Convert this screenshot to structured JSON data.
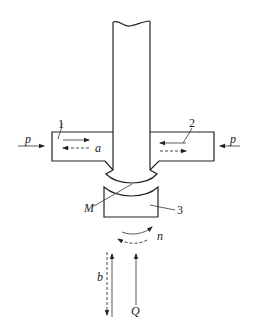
{
  "diagram": {
    "labels": {
      "part_1": "1",
      "part_2": "2",
      "part_3": "3",
      "force_left": "p",
      "force_right": "p",
      "motion_a": "a",
      "point_M": "M",
      "rotation_n": "n",
      "motion_b": "b",
      "force_Q": "Q"
    },
    "colors": {
      "stroke": "#222222",
      "background": "#ffffff"
    }
  }
}
